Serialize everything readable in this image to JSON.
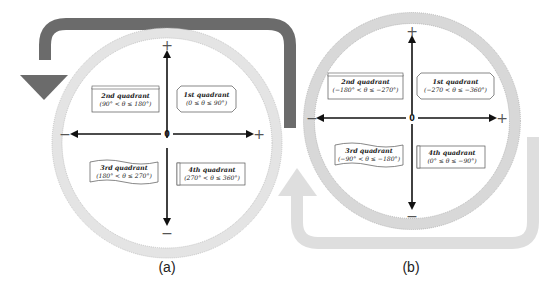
{
  "colors": {
    "dark_arrow": "#6b6b6b",
    "light_arrow": "#dedede",
    "ring_fill": "#e4e4e4",
    "ring_stroke": "#b5b5b5",
    "axis": "#111111"
  },
  "panels": [
    {
      "caption": "(a)",
      "origin_label": "0",
      "axis_signs": {
        "top": "+",
        "bottom": "−",
        "left": "−",
        "right": "+"
      },
      "rotation_arrow": "counterclockwise",
      "quadrants": [
        {
          "name": "2nd quadrant",
          "range": "(90° < θ ≤ 180°)"
        },
        {
          "name": "1st quadrant",
          "range": "(0 ≤ θ ≤ 90°)"
        },
        {
          "name": "3rd quadrant",
          "range": "(180° < θ ≤ 270°)"
        },
        {
          "name": "4th quadrant",
          "range": "(270° < θ ≤ 360°)"
        }
      ]
    },
    {
      "caption": "(b)",
      "origin_label": "0",
      "axis_signs": {
        "top": "+",
        "bottom": "−",
        "left": "−",
        "right": "+"
      },
      "rotation_arrow": "clockwise",
      "quadrants": [
        {
          "name": "2nd quadrant",
          "range": "(−180° < θ ≤ −270°)"
        },
        {
          "name": "1st quadrant",
          "range": "(−270 < θ ≤ −360°)"
        },
        {
          "name": "3rd quadrant",
          "range": "(−90° < θ ≤ −180°)"
        },
        {
          "name": "4th quadrant",
          "range": "(0° ≤ θ ≤ −90°)"
        }
      ]
    }
  ]
}
